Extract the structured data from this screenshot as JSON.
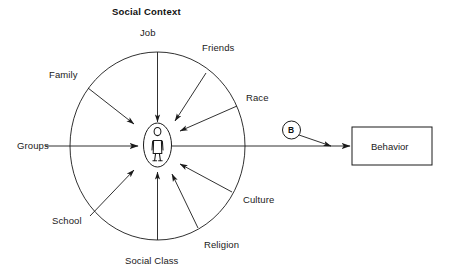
{
  "figure": {
    "title": "Social Context",
    "background_color": "#ffffff",
    "stroke_color": "#1a1a1a"
  },
  "center": {
    "icon_name": "person-figure-icon",
    "shape": "ellipse"
  },
  "influences": [
    {
      "id": "job",
      "label": "Job",
      "position": "top"
    },
    {
      "id": "friends",
      "label": "Friends",
      "position": "top-right"
    },
    {
      "id": "race",
      "label": "Race",
      "position": "right-upper"
    },
    {
      "id": "culture",
      "label": "Culture",
      "position": "right-lower"
    },
    {
      "id": "religion",
      "label": "Religion",
      "position": "bottom-right"
    },
    {
      "id": "social-class",
      "label": "Social Class",
      "position": "bottom"
    },
    {
      "id": "school",
      "label": "School",
      "position": "bottom-left"
    },
    {
      "id": "groups",
      "label": "Groups",
      "position": "left"
    },
    {
      "id": "family",
      "label": "Family",
      "position": "top-left"
    }
  ],
  "behavior_node": {
    "marker_label": "B",
    "box_label": "Behavior"
  }
}
